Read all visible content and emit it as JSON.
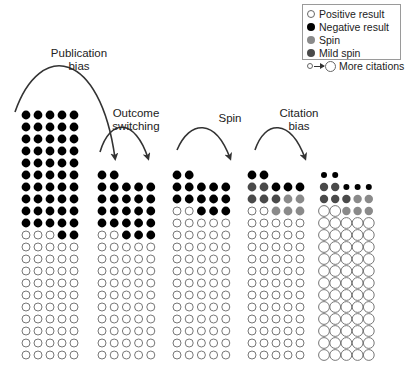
{
  "colors": {
    "positive": "#ffffff",
    "negative": "#000000",
    "spin": "#8a8a8a",
    "mild_spin": "#4a4a4a",
    "outline": "#777777",
    "arrow": "#333333"
  },
  "legend": {
    "items": [
      {
        "key": "positive",
        "label": "Positive result"
      },
      {
        "key": "negative",
        "label": "Negative result"
      },
      {
        "key": "spin",
        "label": "Spin"
      },
      {
        "key": "mild_spin",
        "label": "Mild spin"
      }
    ],
    "citations_label": "More citations"
  },
  "stages": [
    {
      "label_line1": "Publication",
      "label_line2": "bias"
    },
    {
      "label_line1": "Outcome",
      "label_line2": "switching"
    },
    {
      "label_line1": "Spin",
      "label_line2": ""
    },
    {
      "label_line1": "Citation",
      "label_line2": "bias"
    }
  ],
  "grids": [
    {
      "name": "all-trials",
      "x0": 26,
      "y_bottom": 355,
      "dx": 12,
      "dy": 12,
      "r": 4.4,
      "white_r": 4.0,
      "rows": [
        "NNNNN",
        "NNNNN",
        "NNNNN",
        "NNNNN",
        "NNNNN",
        "NNNNN",
        "NNNNN",
        "NNNNN",
        "NNNNN",
        "NNNNN",
        "PPPNN",
        "PPPPP",
        "PPPPP",
        "PPPPP",
        "PPPPP",
        "PPPPP",
        "PPPPP",
        "PPPPP",
        "PPPPP",
        "PPPPP",
        "PPPPP"
      ]
    },
    {
      "name": "after-publication-bias",
      "x0": 102,
      "y_bottom": 355,
      "dx": 12.2,
      "dy": 12,
      "r": 4.4,
      "white_r": 4.0,
      "rows": [
        "NN...",
        "NNNNN",
        "NNNNN",
        "NNNNN",
        "NNNNN",
        "PPNNN",
        "PPPPP",
        "PPPPP",
        "PPPPP",
        "PPPPP",
        "PPPPP",
        "PPPPP",
        "PPPPP",
        "PPPPP",
        "PPPPP",
        "PPPPP"
      ]
    },
    {
      "name": "after-outcome-switching",
      "x0": 177,
      "y_bottom": 355,
      "dx": 12.2,
      "dy": 12,
      "r": 4.4,
      "white_r": 4.0,
      "rows": [
        "NN...",
        "NNNNN",
        "NNNNN",
        "PPNNN",
        "PPPPP",
        "PPPPP",
        "PPPPP",
        "PPPPP",
        "PPPPP",
        "PPPPP",
        "PPPPP",
        "PPPPP",
        "PPPPP",
        "PPPPP",
        "PPPPP",
        "PPPPP"
      ]
    },
    {
      "name": "after-spin",
      "x0": 252,
      "y_bottom": 355,
      "dx": 12,
      "dy": 12,
      "r": 4.4,
      "white_r": 4.0,
      "rows": [
        "NN...",
        "MMNNN",
        "MMMSS",
        "PPSSS",
        "PPPPP",
        "PPPPP",
        "PPPPP",
        "PPPPP",
        "PPPPP",
        "PPPPP",
        "PPPPP",
        "PPPPP",
        "PPPPP",
        "PPPPP",
        "PPPPP",
        "PPPPP"
      ]
    },
    {
      "name": "after-citation-bias",
      "x0": 324,
      "y_bottom": 355,
      "dx": 11.2,
      "dy": 12,
      "r": 3.0,
      "white_r": 5.4,
      "spin_r": 4.2,
      "rows": [
        "NN...",
        "MMNNN",
        "MMMSS",
        "PPSSS",
        "PPPPP",
        "PPPPP",
        "PPPPP",
        "PPPPP",
        "PPPPP",
        "PPPPP",
        "PPPPP",
        "PPPPP",
        "PPPPP",
        "PPPPP",
        "PPPPP",
        "PPPPP"
      ]
    }
  ],
  "arrows": [
    {
      "name": "publication-bias-arrow",
      "path": "M 15 112 C 40 40, 100 50, 115 158"
    },
    {
      "name": "outcome-switching-arrow",
      "path": "M 100 152 C 110 118, 135 118, 148 158"
    },
    {
      "name": "spin-arrow",
      "path": "M 177 150 C 190 120, 215 118, 230 158"
    },
    {
      "name": "citation-bias-arrow",
      "path": "M 255 150 C 265 120, 290 118, 305 158"
    }
  ]
}
